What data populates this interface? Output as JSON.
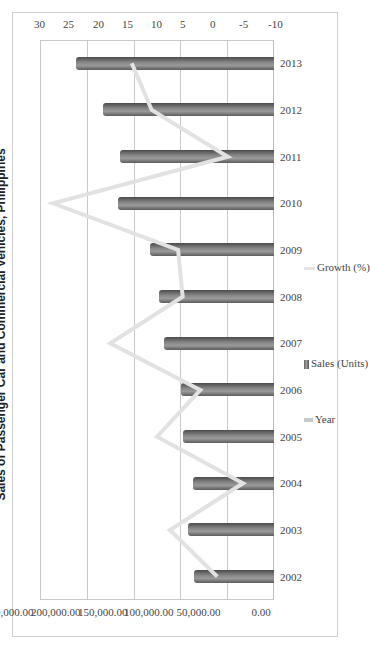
{
  "chart_data": {
    "type": "bar",
    "title": "Sales of Passenger Car and Commercial Vehicles, Philippines",
    "orientation_note": "chart image rotated 90 degrees",
    "categories": [
      "2002",
      "2003",
      "2004",
      "2005",
      "2006",
      "2007",
      "2008",
      "2009",
      "2010",
      "2011",
      "2012",
      "2013"
    ],
    "series": [
      {
        "name": "Sales (Units)",
        "type": "bar",
        "axis": "left",
        "values": [
          85000,
          91500,
          87000,
          97000,
          99000,
          117000,
          123000,
          132000,
          167000,
          165000,
          183000,
          212000
        ]
      },
      {
        "name": "Growth (%)",
        "type": "line",
        "axis": "right",
        "values": [
          -0.3,
          7.8,
          -4.7,
          10.0,
          2.6,
          18.0,
          5.6,
          6.4,
          27.8,
          -2.1,
          10.9,
          14.3
        ]
      }
    ],
    "legend": [
      "Year",
      "Sales (Units)",
      "Growth (%)"
    ],
    "legend_position": "bottom",
    "left_axis": {
      "ylim": [
        0,
        250000
      ],
      "ticks": [
        "0.00",
        "50,000.00",
        "100,000.00",
        "150,000.00",
        "200,000.00",
        "250,000.00"
      ]
    },
    "right_axis": {
      "ylim": [
        -10,
        30
      ],
      "ticks": [
        "-10",
        "-5",
        "0",
        "5",
        "10",
        "15",
        "20",
        "25",
        "30"
      ]
    },
    "xlabel": "",
    "ylabel": "",
    "grid": true,
    "colors": {
      "bar": "#7a7a7a",
      "line": "#e2e2e2",
      "grid": "#c9c9c9"
    }
  }
}
